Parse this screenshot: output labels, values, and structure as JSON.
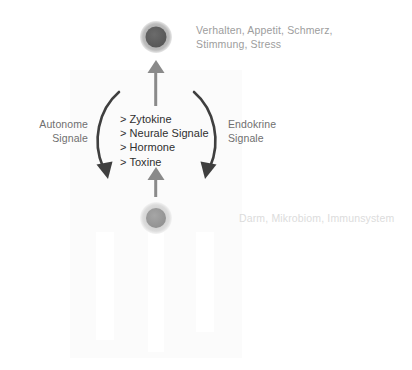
{
  "diagram": {
    "type": "gut-brain-axis",
    "background_color": "#ffffff",
    "nodes": [
      {
        "id": "brain",
        "role": "upper-node",
        "cx": 156,
        "cy": 37,
        "ring_color": "#b4b4b4",
        "core_color": "#5e5e5e",
        "label": "Verhalten, Appetit, Schmerz,\nStimmung, Stress",
        "label_color": "#9d9d9d"
      },
      {
        "id": "gut",
        "role": "lower-node",
        "cx": 156,
        "cy": 218,
        "ring_color": "#d6d6d6",
        "core_color": "#9a9a9a",
        "label": "Darm, Mikrobiom, Immunsystem",
        "label_color": "#dcdcdc"
      }
    ],
    "side_labels": {
      "left": "Autonome\nSignale",
      "right": "Endokrine\nSignale",
      "color": "#6f6f6f"
    },
    "mediators": {
      "bullet": ">",
      "items": [
        "Zytokine",
        "Neurale Signale",
        "Hormone",
        "Toxine"
      ],
      "color": "#2f2f2f"
    },
    "arrows": {
      "stroke_color": "#7d7d7d",
      "curved_stroke_color": "#3c3c3c",
      "straight": [
        {
          "id": "gut-to-brain-upper",
          "direction": "up",
          "x": 156,
          "from_y": 106,
          "to_y": 61
        },
        {
          "id": "gut-to-brain-lower",
          "direction": "up",
          "x": 156,
          "from_y": 196,
          "to_y": 168
        }
      ],
      "curved": [
        {
          "id": "autonome-arc",
          "side": "left",
          "direction": "downward"
        },
        {
          "id": "endokrine-arc",
          "side": "right",
          "direction": "downward"
        }
      ]
    }
  }
}
